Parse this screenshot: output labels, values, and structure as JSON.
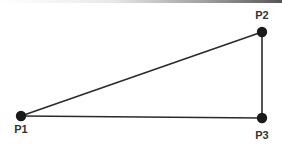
{
  "diagram": {
    "type": "triangle",
    "colors": {
      "line": "#2a2a2a",
      "point": "#1a1a1a",
      "label": "#333333",
      "background": "#ffffff"
    },
    "points": [
      {
        "id": "P1",
        "label": "P1",
        "x": 21,
        "y": 116
      },
      {
        "id": "P2",
        "label": "P2",
        "x": 262,
        "y": 32
      },
      {
        "id": "P3",
        "label": "P3",
        "x": 262,
        "y": 118
      }
    ],
    "edges": [
      {
        "from": "P1",
        "to": "P2"
      },
      {
        "from": "P2",
        "to": "P3"
      },
      {
        "from": "P3",
        "to": "P1"
      }
    ]
  }
}
